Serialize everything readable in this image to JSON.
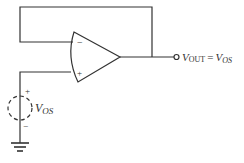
{
  "diagram": {
    "type": "op-amp voltage follower measuring offset voltage",
    "opamp": {
      "inverting_label": "−",
      "noninverting_label": "+"
    },
    "source": {
      "label_main": "V",
      "label_sub": "OS",
      "plus": "+",
      "minus": "−",
      "style": "dashed"
    },
    "output": {
      "lhs_main": "V",
      "lhs_sub": "OUT",
      "equals": "=",
      "rhs_main": "V",
      "rhs_sub": "OS"
    },
    "colors": {
      "line": "#333333",
      "background": "#ffffff"
    }
  }
}
